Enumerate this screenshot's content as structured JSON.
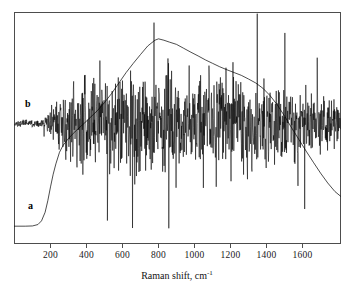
{
  "figure": {
    "background_color": "#ffffff",
    "frame_color": "#4d4d4d",
    "trace_color": "#000000"
  },
  "axis": {
    "x_title_text": "Raman shift, cm",
    "x_title_superscript": "-1",
    "tick_labels": [
      "200",
      "400",
      "600",
      "800",
      "1000",
      "1200",
      "1400",
      "1600"
    ]
  },
  "labels": {
    "curve_a": "a",
    "curve_b": "b"
  },
  "chart_data": {
    "type": "line",
    "title": "",
    "xlabel": "Raman shift, cm-1",
    "ylabel": "",
    "xlim": [
      0,
      1811
    ],
    "ylim": [
      0,
      1
    ],
    "grid": false,
    "legend": "inline-curve-labels",
    "xticks": [
      200,
      400,
      600,
      800,
      1000,
      1200,
      1400,
      1600
    ],
    "series": [
      {
        "name": "a",
        "label": "a",
        "description": "Smooth broad luminescence background: flat at low intensity below ~200 cm-1, steep rise to ~250 cm-1, gradual climb to a broad maximum near 780-900 cm-1, then monotonic decline to the high-wavenumber edge.",
        "x": [
          0,
          60,
          100,
          130,
          150,
          170,
          185,
          200,
          215,
          230,
          250,
          270,
          300,
          340,
          380,
          420,
          460,
          500,
          540,
          580,
          620,
          660,
          700,
          740,
          780,
          800,
          830,
          860,
          900,
          940,
          980,
          1020,
          1060,
          1100,
          1140,
          1180,
          1220,
          1260,
          1300,
          1340,
          1380,
          1420,
          1460,
          1500,
          1540,
          1580,
          1620,
          1660,
          1700,
          1740,
          1780,
          1811
        ],
        "y": [
          0.075,
          0.075,
          0.076,
          0.082,
          0.098,
          0.135,
          0.185,
          0.245,
          0.3,
          0.345,
          0.395,
          0.425,
          0.455,
          0.487,
          0.515,
          0.545,
          0.575,
          0.61,
          0.65,
          0.695,
          0.74,
          0.78,
          0.818,
          0.855,
          0.88,
          0.886,
          0.88,
          0.872,
          0.862,
          0.845,
          0.828,
          0.812,
          0.795,
          0.78,
          0.765,
          0.752,
          0.74,
          0.728,
          0.712,
          0.695,
          0.672,
          0.64,
          0.6,
          0.552,
          0.5,
          0.45,
          0.4,
          0.352,
          0.305,
          0.262,
          0.225,
          0.205
        ]
      },
      {
        "name": "b",
        "label": "b",
        "description": "Noise-dominated difference spectrum centered on a flat baseline; nearly featureless below ~250 cm-1, then large-amplitude random fluctuations peaking in the 500-1500 cm-1 region with several extreme downward spikes, diminishing toward the high-wavenumber edge.",
        "baseline": 0.52,
        "noise_envelope_x": [
          0,
          150,
          220,
          260,
          320,
          400,
          500,
          600,
          700,
          800,
          900,
          1000,
          1100,
          1200,
          1300,
          1400,
          1500,
          1600,
          1700,
          1811
        ],
        "noise_envelope_amplitude": [
          0.012,
          0.018,
          0.09,
          0.15,
          0.165,
          0.175,
          0.195,
          0.215,
          0.23,
          0.235,
          0.225,
          0.205,
          0.215,
          0.225,
          0.2,
          0.185,
          0.17,
          0.14,
          0.115,
          0.1
        ]
      }
    ]
  }
}
